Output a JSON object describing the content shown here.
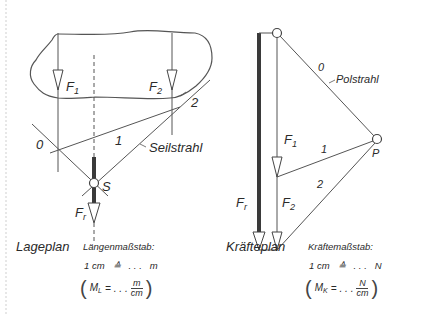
{
  "lageplan": {
    "title": "Lageplan",
    "scale_heading": "Längenmaßstab:",
    "scale_line": {
      "lhs": "1 cm",
      "corr": "≙",
      "dots": ". . .",
      "unit": "m"
    },
    "formula": {
      "symbol": "M",
      "subscript": "L",
      "eq": "=",
      "dots": ". . .",
      "num": "m",
      "den": "cm"
    },
    "labels": {
      "f1": "F",
      "f1_sub": "1",
      "f2": "F",
      "f2_sub": "2",
      "fr": "F",
      "fr_sub": "r",
      "s": "S",
      "ray0": "0",
      "ray1": "1",
      "ray2": "2",
      "seilstrahl": "Seilstrahl"
    }
  },
  "kraefteplan": {
    "title": "Kräfteplan",
    "scale_heading": "Kräftemaßstab:",
    "scale_line": {
      "lhs": "1 cm",
      "corr": "≙",
      "dots": ". . .",
      "unit": "N"
    },
    "formula": {
      "symbol": "M",
      "subscript": "K",
      "eq": "=",
      "dots": ". . .",
      "num": "N",
      "den": "cm"
    },
    "labels": {
      "f1": "F",
      "f1_sub": "1",
      "f2": "F",
      "f2_sub": "2",
      "fr": "F",
      "fr_sub": "r",
      "p": "P",
      "ray0": "0",
      "ray1": "1",
      "ray2": "2",
      "polstrahl": "Polstrahl"
    }
  },
  "colors": {
    "line": "#555555",
    "thick": "#3a3a3a",
    "text": "#2a2a2a"
  }
}
